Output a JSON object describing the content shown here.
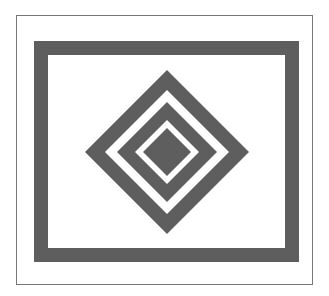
{
  "figure": {
    "colors": {
      "background": "#ffffff",
      "shape_fill": "#5e5e5e",
      "outer_border": "#777777"
    },
    "outer_border": {
      "x": 16,
      "y": 15,
      "w": 296,
      "h": 269
    },
    "frame": {
      "x": 34,
      "y": 41,
      "w": 265,
      "h": 221,
      "thickness": 14
    },
    "diamond_center": {
      "cx": 167,
      "cy": 152
    },
    "diamond_rings": [
      82,
      62,
      50,
      32,
      24
    ]
  }
}
